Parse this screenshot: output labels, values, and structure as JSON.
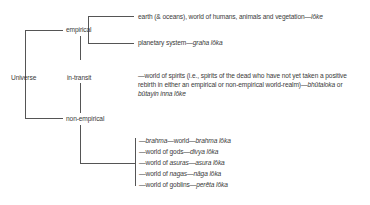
{
  "diagram": {
    "root": "Universe",
    "branches": {
      "empirical": {
        "label": "empirical",
        "items": [
          {
            "text": "earth (& oceans), world of humans, animals and vegetation—",
            "term": "lōke"
          },
          {
            "text": "planetary system—",
            "term": "graha lōka"
          }
        ]
      },
      "in_transit": {
        "label": "in-transit",
        "line1": "—world of spirits (i.e., spirits of the dead who have not yet taken a positive",
        "line2": "rebirth in either an empirical or non-empirical world-realm)—",
        "term1": "bhūtaloka",
        "or": " or",
        "term2": "būtayin inna lōke"
      },
      "non_empirical": {
        "label": "non-empirical",
        "items": [
          {
            "pre": "—",
            "a": "brahma",
            "mid": "—world—",
            "term": "brahma lōka"
          },
          {
            "pre": "—world of gods—",
            "a": "",
            "mid": "",
            "term": "divya lōka"
          },
          {
            "pre": "—world of ",
            "a": "asuras",
            "mid": "—",
            "term": "asura lōka"
          },
          {
            "pre": "—world of ",
            "a": "nagas",
            "mid": "—",
            "term": "nāga lōka"
          },
          {
            "pre": "—world of goblins—",
            "a": "",
            "mid": "",
            "term": "perēta lōka"
          }
        ]
      }
    },
    "colors": {
      "line": "#555555",
      "text": "#3a3a3a",
      "background": "#ffffff"
    }
  }
}
